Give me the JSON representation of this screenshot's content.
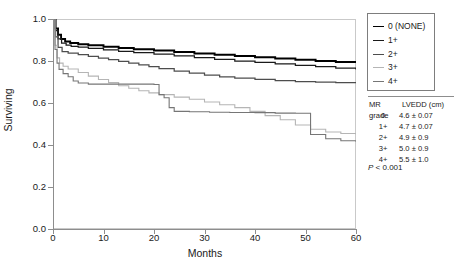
{
  "chart_data": {
    "type": "line",
    "title": "",
    "xlabel": "Months",
    "ylabel": "Surviving",
    "xlim": [
      0,
      60
    ],
    "ylim": [
      0.0,
      1.0
    ],
    "xticks": [
      0,
      10,
      20,
      30,
      40,
      50,
      60
    ],
    "xtick_labels": [
      "0",
      "10",
      "20",
      "30",
      "40",
      "50",
      "60"
    ],
    "yticks": [
      0.0,
      0.2,
      0.4,
      0.6,
      0.8,
      1.0
    ],
    "ytick_labels": [
      "0.0",
      "0.2",
      "0.4",
      "0.6",
      "0.8",
      "1.0"
    ],
    "grid": false,
    "legend_position": "right-top",
    "series": [
      {
        "name": "0 (NONE)",
        "color": "#000000",
        "width": 1.9,
        "points": [
          [
            0,
            1.0
          ],
          [
            0.5,
            0.955
          ],
          [
            1,
            0.925
          ],
          [
            1.6,
            0.905
          ],
          [
            2.4,
            0.893
          ],
          [
            3.4,
            0.886
          ],
          [
            5,
            0.88
          ],
          [
            7,
            0.875
          ],
          [
            10,
            0.868
          ],
          [
            13,
            0.862
          ],
          [
            16,
            0.856
          ],
          [
            20,
            0.85
          ],
          [
            24,
            0.843
          ],
          [
            28,
            0.836
          ],
          [
            32,
            0.83
          ],
          [
            36,
            0.824
          ],
          [
            40,
            0.818
          ],
          [
            44,
            0.812
          ],
          [
            48,
            0.806
          ],
          [
            52,
            0.8
          ],
          [
            56,
            0.795
          ],
          [
            60,
            0.79
          ]
        ]
      },
      {
        "name": "1+",
        "color": "#1a1a1a",
        "width": 1.25,
        "points": [
          [
            0,
            1.0
          ],
          [
            0.5,
            0.945
          ],
          [
            1,
            0.905
          ],
          [
            1.7,
            0.885
          ],
          [
            2.6,
            0.876
          ],
          [
            3.6,
            0.87
          ],
          [
            5,
            0.866
          ],
          [
            7,
            0.86
          ],
          [
            10,
            0.853
          ],
          [
            13,
            0.846
          ],
          [
            16,
            0.84
          ],
          [
            20,
            0.833
          ],
          [
            24,
            0.824
          ],
          [
            28,
            0.816
          ],
          [
            32,
            0.808
          ],
          [
            36,
            0.8
          ],
          [
            40,
            0.793
          ],
          [
            44,
            0.786
          ],
          [
            48,
            0.779
          ],
          [
            52,
            0.773
          ],
          [
            56,
            0.766
          ],
          [
            60,
            0.76
          ]
        ]
      },
      {
        "name": "2+",
        "color": "#4d4d4d",
        "width": 1.25,
        "points": [
          [
            0,
            1.0
          ],
          [
            0.5,
            0.915
          ],
          [
            1,
            0.865
          ],
          [
            1.8,
            0.845
          ],
          [
            3,
            0.838
          ],
          [
            5,
            0.83
          ],
          [
            7,
            0.822
          ],
          [
            9,
            0.814
          ],
          [
            11,
            0.806
          ],
          [
            13,
            0.798
          ],
          [
            15,
            0.79
          ],
          [
            17,
            0.782
          ],
          [
            19,
            0.773
          ],
          [
            21,
            0.764
          ],
          [
            24,
            0.752
          ],
          [
            27,
            0.742
          ],
          [
            30,
            0.733
          ],
          [
            33,
            0.725
          ],
          [
            36,
            0.718
          ],
          [
            40,
            0.712
          ],
          [
            44,
            0.706
          ],
          [
            48,
            0.702
          ],
          [
            52,
            0.699
          ],
          [
            56,
            0.697
          ],
          [
            60,
            0.695
          ]
        ]
      },
      {
        "name": "3+",
        "color": "#b5b5b5",
        "width": 1.1,
        "points": [
          [
            0,
            1.0
          ],
          [
            0.4,
            0.875
          ],
          [
            0.8,
            0.815
          ],
          [
            1.3,
            0.79
          ],
          [
            2,
            0.775
          ],
          [
            3,
            0.762
          ],
          [
            5,
            0.745
          ],
          [
            7,
            0.728
          ],
          [
            9,
            0.712
          ],
          [
            11,
            0.697
          ],
          [
            13,
            0.682
          ],
          [
            15,
            0.67
          ],
          [
            17,
            0.658
          ],
          [
            19,
            0.648
          ],
          [
            21,
            0.64
          ],
          [
            24,
            0.628
          ],
          [
            27,
            0.618
          ],
          [
            30,
            0.605
          ],
          [
            33,
            0.592
          ],
          [
            36,
            0.578
          ],
          [
            39,
            0.56
          ],
          [
            42,
            0.54
          ],
          [
            45,
            0.52
          ],
          [
            48,
            0.495
          ],
          [
            51,
            0.475
          ],
          [
            54,
            0.462
          ],
          [
            57,
            0.455
          ],
          [
            60,
            0.45
          ]
        ]
      },
      {
        "name": "4+",
        "color": "#767676",
        "width": 1.1,
        "points": [
          [
            0,
            1.0
          ],
          [
            0.4,
            0.855
          ],
          [
            0.8,
            0.79
          ],
          [
            1.2,
            0.76
          ],
          [
            2,
            0.74
          ],
          [
            3,
            0.725
          ],
          [
            4,
            0.705
          ],
          [
            5,
            0.695
          ],
          [
            7,
            0.69
          ],
          [
            10,
            0.69
          ],
          [
            14,
            0.69
          ],
          [
            17,
            0.69
          ],
          [
            20,
            0.688
          ],
          [
            21,
            0.64
          ],
          [
            22,
            0.625
          ],
          [
            23,
            0.578
          ],
          [
            24,
            0.56
          ],
          [
            27,
            0.558
          ],
          [
            31,
            0.556
          ],
          [
            35,
            0.555
          ],
          [
            40,
            0.554
          ],
          [
            44,
            0.552
          ],
          [
            48,
            0.551
          ],
          [
            51,
            0.45
          ],
          [
            54,
            0.43
          ],
          [
            57,
            0.42
          ],
          [
            60,
            0.415
          ]
        ]
      }
    ]
  },
  "legend": {
    "items": [
      {
        "label": "0 (NONE)",
        "color": "#000000",
        "width": "1.9px"
      },
      {
        "label": "1+",
        "color": "#1a1a1a",
        "width": "1.3px"
      },
      {
        "label": "2+",
        "color": "#4d4d4d",
        "width": "1.2px"
      },
      {
        "label": "3+",
        "color": "#b5b5b5",
        "width": "1.1px"
      },
      {
        "label": "4+",
        "color": "#767676",
        "width": "1.1px"
      }
    ]
  },
  "stats_table": {
    "headers": {
      "grade": "MR grade",
      "lvedd": "LVEDD (cm)"
    },
    "rows": [
      {
        "grade": "0",
        "lvedd": "4.6 ± 0.07"
      },
      {
        "grade": "1+",
        "lvedd": "4.7 ± 0.07"
      },
      {
        "grade": "2+",
        "lvedd": "4.9 ± 0.9"
      },
      {
        "grade": "3+",
        "lvedd": "5.0 ± 0.9"
      },
      {
        "grade": "4+",
        "lvedd": "5.5 ± 1.0"
      }
    ],
    "pvalue_symbol": "P",
    "pvalue_rest": " < 0.001"
  }
}
